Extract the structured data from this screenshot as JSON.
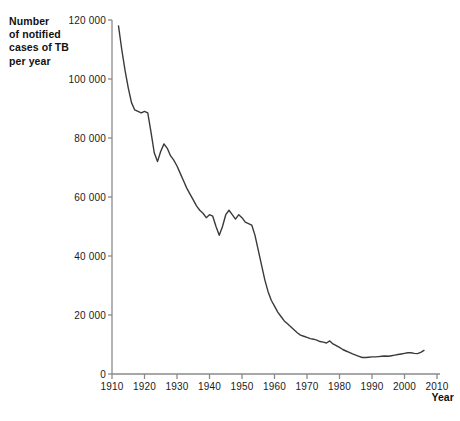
{
  "chart_data": {
    "type": "line",
    "title": "",
    "ylabel": "Number\nof notified\ncases of TB\nper year",
    "xlabel": "Year",
    "xlim": [
      1910,
      2010
    ],
    "ylim": [
      0,
      120000
    ],
    "xticks": [
      1910,
      1920,
      1930,
      1940,
      1950,
      1960,
      1970,
      1980,
      1990,
      2000,
      2010
    ],
    "xtick_labels": [
      "1910",
      "1920",
      "1930",
      "1940",
      "1950",
      "1960",
      "1970",
      "1980",
      "1990",
      "2000",
      "2010"
    ],
    "yticks": [
      0,
      20000,
      40000,
      60000,
      80000,
      100000,
      120000
    ],
    "ytick_labels": [
      "0",
      "20 000",
      "40 000",
      "60 000",
      "80 000",
      "100 000",
      "120 000"
    ],
    "grid": false,
    "legend": false,
    "line_color": "#3a3a3a",
    "axis_color": "#8a8a8a",
    "series": [
      {
        "name": "Notified TB cases per year",
        "x": [
          1912,
          1913,
          1914,
          1915,
          1916,
          1917,
          1918,
          1919,
          1920,
          1921,
          1922,
          1923,
          1924,
          1925,
          1926,
          1927,
          1928,
          1929,
          1930,
          1931,
          1932,
          1933,
          1934,
          1935,
          1936,
          1937,
          1938,
          1939,
          1940,
          1941,
          1942,
          1943,
          1944,
          1945,
          1946,
          1947,
          1948,
          1949,
          1950,
          1951,
          1952,
          1953,
          1954,
          1955,
          1956,
          1957,
          1958,
          1959,
          1960,
          1961,
          1962,
          1963,
          1964,
          1965,
          1966,
          1967,
          1968,
          1969,
          1970,
          1971,
          1972,
          1973,
          1974,
          1975,
          1976,
          1977,
          1978,
          1979,
          1980,
          1981,
          1982,
          1983,
          1984,
          1985,
          1986,
          1987,
          1988,
          1989,
          1990,
          1991,
          1992,
          1993,
          1994,
          1995,
          1996,
          1997,
          1998,
          1999,
          2000,
          2001,
          2002,
          2003,
          2004,
          2005,
          2006
        ],
        "values": [
          118000,
          110000,
          103000,
          97000,
          92000,
          89500,
          89000,
          88500,
          89000,
          88500,
          82000,
          75000,
          72000,
          75500,
          78000,
          76500,
          74000,
          72500,
          70500,
          68000,
          65500,
          63000,
          61000,
          59000,
          57000,
          55500,
          54500,
          53000,
          54000,
          53500,
          50000,
          47000,
          50000,
          54000,
          55500,
          54000,
          52500,
          54000,
          53000,
          51500,
          51000,
          50500,
          47000,
          42000,
          37000,
          32000,
          28000,
          25000,
          23000,
          21000,
          19500,
          18000,
          17000,
          16000,
          15000,
          14000,
          13200,
          12800,
          12400,
          12000,
          11800,
          11500,
          11000,
          10800,
          10500,
          11200,
          10200,
          9600,
          9000,
          8300,
          7800,
          7300,
          6800,
          6400,
          6000,
          5600,
          5600,
          5700,
          5800,
          5800,
          5900,
          6000,
          6100,
          6000,
          6200,
          6400,
          6600,
          6800,
          7000,
          7200,
          7200,
          7000,
          6900,
          7300,
          8000
        ]
      }
    ]
  },
  "caption": ""
}
